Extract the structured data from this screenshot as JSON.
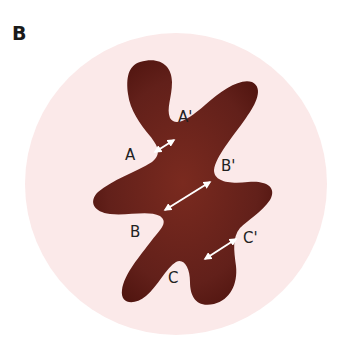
{
  "panel": {
    "label": "B"
  },
  "colors": {
    "background": "#ffffff",
    "circle_fill": "#fbe9e9",
    "blob_center": "#7a2a1f",
    "blob_edge": "#4e130e",
    "arrow": "#ffffff",
    "label_text": "#222222"
  },
  "labels": {
    "A": "A",
    "A_prime": "A'",
    "B": "B",
    "B_prime": "B'",
    "C": "C",
    "C_prime": "C'"
  },
  "annotations": [
    {
      "from": "A",
      "to": "A'",
      "description": "double-headed arrow across upper neck"
    },
    {
      "from": "B",
      "to": "B'",
      "description": "double-headed arrow across central body"
    },
    {
      "from": "C",
      "to": "C'",
      "description": "double-headed arrow across lower neck"
    }
  ]
}
